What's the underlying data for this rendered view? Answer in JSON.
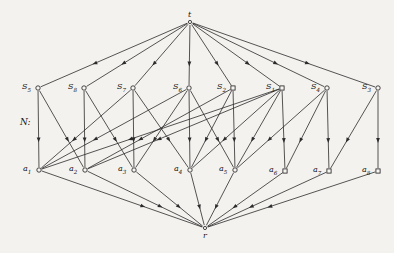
{
  "figure": {
    "caption_label": "N:",
    "stroke_color": "#2b2b2b",
    "node_fill": "#f7f5f2",
    "background": "#f4f2ef"
  },
  "chart_data": {
    "type": "diagram",
    "subtype": "directed-graph",
    "title": "N:",
    "layers": [
      "t",
      "S",
      "a",
      "r"
    ],
    "nodes": [
      {
        "id": "t",
        "label": "t",
        "x": 190,
        "y": 22,
        "shape": "dot",
        "label_pos": "above",
        "layer": "source"
      },
      {
        "id": "S5",
        "label": "S5",
        "x": 38,
        "y": 88,
        "shape": "circle",
        "label_pos": "left",
        "layer": "S"
      },
      {
        "id": "S8",
        "label": "S8",
        "x": 84,
        "y": 88,
        "shape": "circle",
        "label_pos": "left",
        "layer": "S"
      },
      {
        "id": "S7",
        "label": "S7",
        "x": 133,
        "y": 88,
        "shape": "circle",
        "label_pos": "left",
        "layer": "S"
      },
      {
        "id": "S6",
        "label": "S6",
        "x": 189,
        "y": 88,
        "shape": "circle",
        "label_pos": "left",
        "layer": "S"
      },
      {
        "id": "S2",
        "label": "S2",
        "x": 233,
        "y": 88,
        "shape": "square",
        "label_pos": "left",
        "layer": "S"
      },
      {
        "id": "S1",
        "label": "S1",
        "x": 282,
        "y": 88,
        "shape": "square",
        "label_pos": "left",
        "layer": "S"
      },
      {
        "id": "S4",
        "label": "S4",
        "x": 327,
        "y": 88,
        "shape": "circle",
        "label_pos": "left",
        "layer": "S"
      },
      {
        "id": "S3",
        "label": "S3",
        "x": 378,
        "y": 88,
        "shape": "circle",
        "label_pos": "left",
        "layer": "S"
      },
      {
        "id": "a1",
        "label": "a1",
        "x": 39,
        "y": 170,
        "shape": "circle",
        "label_pos": "left",
        "layer": "a"
      },
      {
        "id": "a2",
        "label": "a2",
        "x": 85,
        "y": 170,
        "shape": "circle",
        "label_pos": "left",
        "layer": "a"
      },
      {
        "id": "a3",
        "label": "a3",
        "x": 134,
        "y": 170,
        "shape": "circle",
        "label_pos": "left",
        "layer": "a"
      },
      {
        "id": "a4",
        "label": "a4",
        "x": 190,
        "y": 170,
        "shape": "circle",
        "label_pos": "left",
        "layer": "a"
      },
      {
        "id": "a5",
        "label": "a5",
        "x": 235,
        "y": 170,
        "shape": "circle",
        "label_pos": "left",
        "layer": "a"
      },
      {
        "id": "a6",
        "label": "a6",
        "x": 285,
        "y": 171,
        "shape": "square",
        "label_pos": "left",
        "layer": "a"
      },
      {
        "id": "a7",
        "label": "a7",
        "x": 329,
        "y": 171,
        "shape": "square",
        "label_pos": "left",
        "layer": "a"
      },
      {
        "id": "a8",
        "label": "a8",
        "x": 378,
        "y": 171,
        "shape": "square",
        "label_pos": "left",
        "layer": "a"
      },
      {
        "id": "r",
        "label": "r",
        "x": 205,
        "y": 228,
        "shape": "dot",
        "label_pos": "below",
        "layer": "sink"
      }
    ],
    "node_labels": [
      {
        "id": "t",
        "base": "t",
        "sub": ""
      },
      {
        "id": "S5",
        "base": "S",
        "sub": "5"
      },
      {
        "id": "S8",
        "base": "S",
        "sub": "8"
      },
      {
        "id": "S7",
        "base": "S",
        "sub": "7"
      },
      {
        "id": "S6",
        "base": "S",
        "sub": "6"
      },
      {
        "id": "S2",
        "base": "S",
        "sub": "2"
      },
      {
        "id": "S1",
        "base": "S",
        "sub": "1"
      },
      {
        "id": "S4",
        "base": "S",
        "sub": "4"
      },
      {
        "id": "S3",
        "base": "S",
        "sub": "3"
      },
      {
        "id": "a1",
        "base": "a",
        "sub": "1"
      },
      {
        "id": "a2",
        "base": "a",
        "sub": "2"
      },
      {
        "id": "a3",
        "base": "a",
        "sub": "3"
      },
      {
        "id": "a4",
        "base": "a",
        "sub": "4"
      },
      {
        "id": "a5",
        "base": "a",
        "sub": "5"
      },
      {
        "id": "a6",
        "base": "a",
        "sub": "6"
      },
      {
        "id": "a7",
        "base": "a",
        "sub": "7"
      },
      {
        "id": "a8",
        "base": "a",
        "sub": "8"
      },
      {
        "id": "r",
        "base": "r",
        "sub": ""
      }
    ],
    "edges": [
      {
        "from": "t",
        "to": "S5"
      },
      {
        "from": "t",
        "to": "S8"
      },
      {
        "from": "t",
        "to": "S7"
      },
      {
        "from": "t",
        "to": "S6"
      },
      {
        "from": "t",
        "to": "S2"
      },
      {
        "from": "t",
        "to": "S1"
      },
      {
        "from": "t",
        "to": "S4"
      },
      {
        "from": "t",
        "to": "S3"
      },
      {
        "from": "S5",
        "to": "a1"
      },
      {
        "from": "S5",
        "to": "a2"
      },
      {
        "from": "S8",
        "to": "a2"
      },
      {
        "from": "S8",
        "to": "a3"
      },
      {
        "from": "S7",
        "to": "a1"
      },
      {
        "from": "S7",
        "to": "a3"
      },
      {
        "from": "S7",
        "to": "a4"
      },
      {
        "from": "S6",
        "to": "a1"
      },
      {
        "from": "S6",
        "to": "a3"
      },
      {
        "from": "S6",
        "to": "a4"
      },
      {
        "from": "S6",
        "to": "a5"
      },
      {
        "from": "S2",
        "to": "a2"
      },
      {
        "from": "S2",
        "to": "a4"
      },
      {
        "from": "S2",
        "to": "a5"
      },
      {
        "from": "S1",
        "to": "a1"
      },
      {
        "from": "S1",
        "to": "a2"
      },
      {
        "from": "S1",
        "to": "a4"
      },
      {
        "from": "S1",
        "to": "a5"
      },
      {
        "from": "S1",
        "to": "a6"
      },
      {
        "from": "S4",
        "to": "a5"
      },
      {
        "from": "S4",
        "to": "a6"
      },
      {
        "from": "S4",
        "to": "a7"
      },
      {
        "from": "S3",
        "to": "a7"
      },
      {
        "from": "S3",
        "to": "a8"
      },
      {
        "from": "a1",
        "to": "r"
      },
      {
        "from": "a2",
        "to": "r"
      },
      {
        "from": "a3",
        "to": "r"
      },
      {
        "from": "a4",
        "to": "r"
      },
      {
        "from": "a5",
        "to": "r"
      },
      {
        "from": "a6",
        "to": "r"
      },
      {
        "from": "a7",
        "to": "r"
      },
      {
        "from": "a8",
        "to": "r"
      }
    ],
    "edge_count": 40,
    "node_count": 18
  }
}
